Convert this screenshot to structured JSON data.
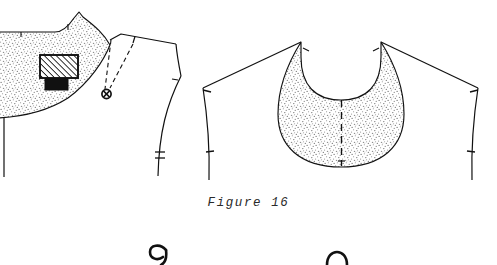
{
  "document": {
    "type": "sewing-pattern-illustration",
    "caption": "Figure 16",
    "background_color": "#ffffff",
    "ink_color": "#111111",
    "stipple_color": "#8c8c8c"
  },
  "caption": {
    "label": "Figure 16"
  },
  "figures": [
    {
      "id": "left-bodice-yoke",
      "name": "bodice front with yoke",
      "elements": [
        {
          "name": "yoke-shaded-region",
          "fill": "stipple"
        },
        {
          "name": "center-front-line",
          "style": "solid"
        },
        {
          "name": "shoulder-seam-line",
          "style": "solid"
        },
        {
          "name": "armhole-curve",
          "style": "solid"
        },
        {
          "name": "side-seam-curve",
          "style": "solid"
        },
        {
          "name": "hatched-patch",
          "style": "diagonal-hatch"
        },
        {
          "name": "solid-black-tab",
          "style": "solid-fill"
        },
        {
          "name": "button-marker",
          "style": "circle-with-cross"
        },
        {
          "name": "guide-line-a",
          "style": "dashed"
        },
        {
          "name": "guide-line-b",
          "style": "dashed"
        },
        {
          "name": "notch-marks",
          "count": 5
        }
      ]
    },
    {
      "id": "right-circular-yoke",
      "name": "circular yoke / collar piece",
      "elements": [
        {
          "name": "collar-shaded-region",
          "fill": "stipple"
        },
        {
          "name": "center-back-line",
          "style": "dashed"
        },
        {
          "name": "left-shoulder-line",
          "style": "solid"
        },
        {
          "name": "right-shoulder-line",
          "style": "solid"
        },
        {
          "name": "left-armhole-curve",
          "style": "solid"
        },
        {
          "name": "right-armhole-curve",
          "style": "solid"
        },
        {
          "name": "notch-marks",
          "count": 6
        }
      ]
    },
    {
      "id": "bottom-partial-left",
      "name": "cropped figure top left",
      "elements": [
        {
          "name": "partial-curve-hook",
          "style": "solid"
        }
      ]
    },
    {
      "id": "bottom-partial-right",
      "name": "cropped figure top right",
      "elements": [
        {
          "name": "partial-curve-arch",
          "style": "solid"
        }
      ]
    }
  ]
}
